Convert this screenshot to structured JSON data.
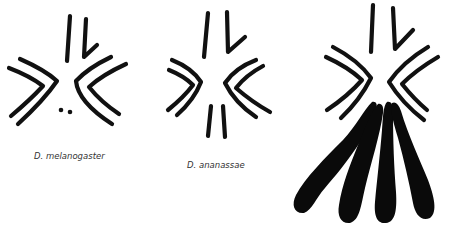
{
  "figures": [
    {
      "species": "D. melanogaster",
      "description": "Chromosome complement schematic with two short rods, two pairs of V-shaped chromosomes and a pair of dot chromosomes"
    },
    {
      "species": "D. ananassae",
      "description": "Chromosome complement schematic with two rods, two pairs of V-shaped chromosomes and a pair of short rods"
    },
    {
      "species": "",
      "description": "Chromosome complement schematic with two rods, two pairs of V-shaped chromosomes and four large heterochromatic club-shaped chromosomes"
    }
  ],
  "colors": {
    "ink": "#111111",
    "background": "#ffffff",
    "caption": "#333333"
  }
}
